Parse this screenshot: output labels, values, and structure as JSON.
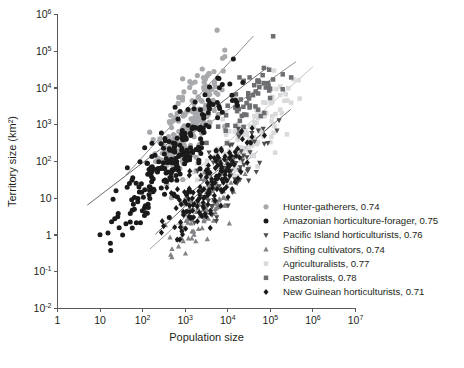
{
  "chart_data": {
    "type": "scatter",
    "title": "",
    "xlabel": "Population size",
    "ylabel": "Territory size (km²)",
    "xscale": "log",
    "yscale": "log",
    "xlim": [
      1,
      10000000
    ],
    "ylim": [
      0.01,
      1000000
    ],
    "grid": false,
    "legend_position": "bottom-right",
    "xticks": [
      {
        "value": 1,
        "label": "1"
      },
      {
        "value": 10,
        "label": "10"
      },
      {
        "value": 100,
        "label": "10",
        "exp": "2"
      },
      {
        "value": 1000,
        "label": "10",
        "exp": "3"
      },
      {
        "value": 10000,
        "label": "10",
        "exp": "4"
      },
      {
        "value": 100000,
        "label": "10",
        "exp": "5"
      },
      {
        "value": 1000000,
        "label": "10",
        "exp": "6"
      },
      {
        "value": 10000000,
        "label": "10",
        "exp": "7"
      }
    ],
    "yticks": [
      {
        "value": 1000000,
        "label": "10",
        "exp": "6"
      },
      {
        "value": 100000,
        "label": "10",
        "exp": "5"
      },
      {
        "value": 10000,
        "label": "10",
        "exp": "4"
      },
      {
        "value": 1000,
        "label": "10",
        "exp": "3"
      },
      {
        "value": 100,
        "label": "10",
        "exp": "2"
      },
      {
        "value": 10,
        "label": "10"
      },
      {
        "value": 1,
        "label": "1"
      },
      {
        "value": 0.1,
        "label": "10",
        "exp": "-1"
      },
      {
        "value": 0.01,
        "label": "10",
        "exp": "-2"
      }
    ],
    "series": [
      {
        "name": "Hunter-gatherers",
        "r": "0.74",
        "legend_label": "Hunter-gatherers, 0.74",
        "marker": "circle",
        "color": "#a7a9ac",
        "size": 5.2,
        "n": 190,
        "x_range": [
          55,
          22000
        ],
        "intercept": -1.05,
        "slope": 1.32,
        "scatter": 0.52,
        "fit": {
          "x0": 40,
          "x1": 40000,
          "y0": 42,
          "y1": 260000,
          "color": "#808285"
        },
        "seed": 11
      },
      {
        "name": "Amazonian horticulture-forager",
        "r": "0.75",
        "legend_label": "Amazonian horticulture-forager, 0.75",
        "marker": "circle",
        "color": "#1a1a1a",
        "size": 5.0,
        "n": 230,
        "x_range": [
          5,
          60000
        ],
        "intercept": -1.32,
        "slope": 1.22,
        "scatter": 0.5,
        "fit": {
          "x0": 5,
          "x1": 90000,
          "y0": 6.5,
          "y1": 38000,
          "color": "#58595b"
        },
        "seed": 23
      },
      {
        "name": "Pacific Island horticulturists",
        "r": "0.76",
        "legend_label": "Pacific Island horticulturists, 0.76",
        "marker": "triangle-down",
        "color": "#4d4d4f",
        "size": 4.6,
        "n": 70,
        "x_range": [
          900,
          260000
        ],
        "intercept": -2.45,
        "slope": 1.02,
        "scatter": 0.42,
        "fit": {
          "x0": 900,
          "x1": 300000,
          "y0": 9.5,
          "y1": 2600,
          "color": "#58595b"
        },
        "seed": 37
      },
      {
        "name": "Shifting cultivators",
        "r": "0.74",
        "legend_label": "Shifting cultivators, 0.74",
        "marker": "triangle-up",
        "color": "#808285",
        "size": 4.6,
        "n": 95,
        "x_range": [
          150,
          40000
        ],
        "intercept": -2.75,
        "slope": 1.05,
        "scatter": 0.4,
        "fit": {
          "x0": 150,
          "x1": 50000,
          "y0": 0.42,
          "y1": 190,
          "color": "#939598"
        },
        "seed": 53
      },
      {
        "name": "Agriculturalists",
        "r": "0.77",
        "legend_label": "Agriculturalists, 0.77",
        "marker": "square",
        "color": "#d9dadb",
        "size": 4.9,
        "n": 130,
        "x_range": [
          900,
          900000
        ],
        "intercept": -2.05,
        "slope": 1.05,
        "scatter": 0.5,
        "fit": {
          "x0": 900,
          "x1": 1000000,
          "y0": 28,
          "y1": 38000,
          "color": "#bcbec0"
        },
        "seed": 71
      },
      {
        "name": "Pastoralists",
        "r": "0.78",
        "legend_label": "Pastoralists, 0.78",
        "marker": "square",
        "color": "#6d6e71",
        "size": 4.9,
        "n": 58,
        "x_range": [
          2500,
          400000
        ],
        "intercept": -1.05,
        "slope": 1.05,
        "scatter": 0.4,
        "fit": {
          "x0": 2500,
          "x1": 400000,
          "y0": 800,
          "y1": 52000,
          "color": "#808285"
        },
        "seed": 97
      },
      {
        "name": "New Guinean horticulturists",
        "r": "0.71",
        "legend_label": "New Guinean horticulturists, 0.71",
        "marker": "diamond",
        "color": "#1a1a1a",
        "size": 4.7,
        "n": 150,
        "x_range": [
          180,
          90000
        ],
        "intercept": -2.55,
        "slope": 1.08,
        "scatter": 0.44,
        "fit": {
          "x0": 200,
          "x1": 120000,
          "y0": 1.05,
          "y1": 1150,
          "color": "#58595b"
        },
        "seed": 131
      }
    ]
  }
}
